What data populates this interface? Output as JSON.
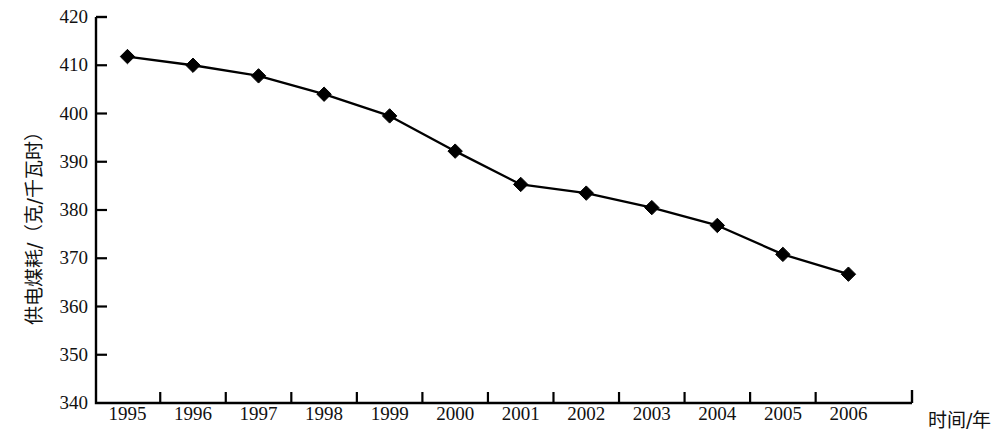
{
  "chart_data": {
    "type": "line",
    "title": "",
    "xlabel": "时间/年",
    "ylabel": "供电煤耗/（克/千瓦时）",
    "categories": [
      "1995",
      "1996",
      "1997",
      "1998",
      "1999",
      "2000",
      "2001",
      "2002",
      "2003",
      "2004",
      "2005",
      "2006"
    ],
    "values": [
      411.8,
      410.0,
      407.8,
      404.0,
      399.5,
      392.2,
      385.3,
      383.5,
      380.5,
      376.8,
      370.8,
      366.7
    ],
    "series": [
      {
        "name": "供电煤耗",
        "values": [
          411.8,
          410.0,
          407.8,
          404.0,
          399.5,
          392.2,
          385.3,
          383.5,
          380.5,
          376.8,
          370.8,
          366.7
        ]
      }
    ],
    "ylim": [
      340,
      420
    ],
    "ytick_labels": [
      "420",
      "410",
      "400",
      "390",
      "380",
      "370",
      "360",
      "350",
      "340"
    ],
    "ytick_values": [
      420,
      410,
      400,
      390,
      380,
      370,
      360,
      350,
      340
    ],
    "grid": false,
    "legend": "none",
    "marker": "diamond",
    "marker_color": "#000000",
    "line_color": "#000000",
    "background_color": "#ffffff"
  }
}
